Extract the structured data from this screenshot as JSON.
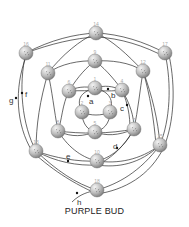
{
  "title": "PURPLE BUD",
  "colors": {
    "line": "#2a2a2a",
    "node_fill_light": "#f2f2f2",
    "node_fill_dark": "#8a8a8a",
    "node_number": "#aaaaaa",
    "label": "#333333"
  },
  "nodes": [
    {
      "id": "1",
      "x": 95,
      "y": 88
    },
    {
      "id": "2",
      "x": 82,
      "y": 112
    },
    {
      "id": "3",
      "x": 110,
      "y": 112
    },
    {
      "id": "4",
      "x": 122,
      "y": 90
    },
    {
      "id": "5",
      "x": 95,
      "y": 132
    },
    {
      "id": "6",
      "x": 69,
      "y": 91
    },
    {
      "id": "7",
      "x": 134,
      "y": 129
    },
    {
      "id": "8",
      "x": 58,
      "y": 131
    },
    {
      "id": "9",
      "x": 95,
      "y": 61
    },
    {
      "id": "10",
      "x": 97,
      "y": 161
    },
    {
      "id": "11",
      "x": 48,
      "y": 73
    },
    {
      "id": "12",
      "x": 143,
      "y": 71
    },
    {
      "id": "13",
      "x": 36,
      "y": 151
    },
    {
      "id": "14",
      "x": 96,
      "y": 33
    },
    {
      "id": "15",
      "x": 160,
      "y": 145
    },
    {
      "id": "16",
      "x": 26,
      "y": 53
    },
    {
      "id": "17",
      "x": 165,
      "y": 53
    },
    {
      "id": "18",
      "x": 97,
      "y": 190
    }
  ],
  "labels": [
    {
      "text": "a",
      "x": 89,
      "y": 104
    },
    {
      "text": "b",
      "x": 111,
      "y": 98
    },
    {
      "text": "c",
      "x": 120,
      "y": 111
    },
    {
      "text": "d",
      "x": 113,
      "y": 149
    },
    {
      "text": "e",
      "x": 66,
      "y": 159
    },
    {
      "text": "f",
      "x": 25,
      "y": 97
    },
    {
      "text": "g",
      "x": 9,
      "y": 103
    },
    {
      "text": "h",
      "x": 77,
      "y": 205
    }
  ],
  "markers": [
    {
      "x": 88,
      "y": 96
    },
    {
      "x": 108,
      "y": 89
    },
    {
      "x": 127,
      "y": 105
    },
    {
      "x": 117,
      "y": 148
    },
    {
      "x": 68,
      "y": 161
    },
    {
      "x": 22,
      "y": 93
    },
    {
      "x": 16,
      "y": 98
    },
    {
      "x": 77,
      "y": 193
    }
  ],
  "edges": [
    {
      "d": "M95,88 C105,85 112,86 122,90"
    },
    {
      "d": "M95,88 C85,86 76,87 69,91"
    },
    {
      "d": "M95,88 C80,92 76,100 82,112"
    },
    {
      "d": "M95,88 C110,92 114,100 110,112"
    },
    {
      "d": "M82,112 C82,124 88,130 95,132"
    },
    {
      "d": "M110,112 C110,124 103,130 95,132"
    },
    {
      "d": "M82,112 C90,116 102,116 110,112"
    },
    {
      "d": "M69,91 C62,105 62,120 58,131"
    },
    {
      "d": "M69,91 C78,76 88,66 95,61"
    },
    {
      "d": "M122,90 C112,76 102,66 95,61"
    },
    {
      "d": "M122,90 C130,104 134,116 134,129"
    },
    {
      "d": "M122,90 C128,104 130,116 130,129"
    },
    {
      "d": "M58,131 C72,138 84,136 95,132"
    },
    {
      "d": "M134,129 C118,136 106,136 95,132"
    },
    {
      "d": "M58,131 C80,134 110,134 134,129"
    },
    {
      "d": "M69,91 C90,90 110,92 122,90"
    },
    {
      "d": "M58,131 C70,150 84,158 97,161"
    },
    {
      "d": "M134,129 C124,148 110,158 97,161"
    },
    {
      "d": "M134,129 C122,150 108,160 97,165"
    },
    {
      "d": "M95,61 C80,60 60,64 48,73"
    },
    {
      "d": "M95,61 C110,60 130,62 143,71"
    },
    {
      "d": "M48,73 C52,90 54,110 58,131"
    },
    {
      "d": "M143,71 C140,90 138,110 134,129"
    },
    {
      "d": "M48,73 C62,55 80,40 96,33"
    },
    {
      "d": "M143,71 C128,55 112,40 96,33"
    },
    {
      "d": "M48,73 C40,100 36,125 36,151"
    },
    {
      "d": "M143,71 C152,95 158,120 160,145"
    },
    {
      "d": "M143,71 C150,95 154,120 156,145"
    },
    {
      "d": "M26,53 C50,40 75,34 96,33"
    },
    {
      "d": "M26,53 C50,44 75,38 96,37"
    },
    {
      "d": "M96,33 C120,34 145,42 165,53"
    },
    {
      "d": "M96,37 C120,38 145,46 165,57"
    },
    {
      "d": "M26,53 C18,85 22,125 36,151"
    },
    {
      "d": "M26,57 C14,88 16,125 32,151"
    },
    {
      "d": "M165,53 C172,85 170,120 160,145"
    },
    {
      "d": "M169,55 C176,88 174,122 164,147"
    },
    {
      "d": "M36,151 C55,158 78,162 97,161"
    },
    {
      "d": "M36,151 C55,162 78,166 97,165"
    },
    {
      "d": "M36,151 C56,170 76,184 97,190"
    },
    {
      "d": "M36,155 C60,176 80,186 97,194"
    },
    {
      "d": "M160,145 C140,160 118,164 97,161"
    },
    {
      "d": "M160,145 C140,164 118,168 97,165"
    },
    {
      "d": "M160,145 C140,172 118,184 97,190"
    },
    {
      "d": "M164,147 C150,176 124,190 97,194"
    },
    {
      "d": "M97,190 C88,192 80,194 72,202"
    }
  ]
}
